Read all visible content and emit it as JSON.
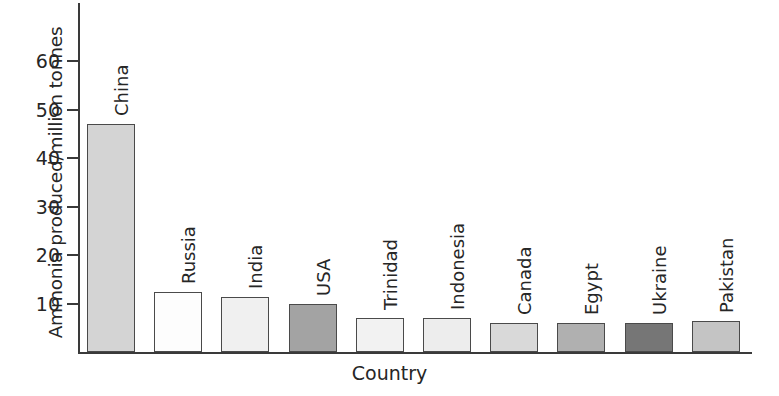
{
  "chart_data": {
    "type": "bar",
    "title": "",
    "xlabel": "Country",
    "ylabel": "Ammonia produced/million tonnes",
    "categories": [
      "China",
      "Russia",
      "India",
      "USA",
      "Trinidad",
      "Indonesia",
      "Canada",
      "Egypt",
      "Ukraine",
      "Pakistan"
    ],
    "values": [
      47,
      12.3,
      11.3,
      10,
      7,
      7,
      6,
      6,
      6,
      6.3
    ],
    "bar_colors": [
      "#d4d4d4",
      "#fdfdfd",
      "#f0f0f0",
      "#a3a3a3",
      "#f2f2f2",
      "#ededed",
      "#d9d9d9",
      "#b0b0b0",
      "#767676",
      "#c4c4c4"
    ],
    "ylim": [
      0,
      72
    ],
    "xlim_note": "categorical",
    "yticks": [
      10,
      20,
      30,
      40,
      50,
      60
    ],
    "ytick_labels": [
      "10",
      "20",
      "30",
      "40",
      "50",
      "60"
    ],
    "grid": false,
    "legend": "none",
    "axis_color": "#3a3a3a",
    "bar_edge_color": "#4a4a4a",
    "text_color": "#262626"
  }
}
